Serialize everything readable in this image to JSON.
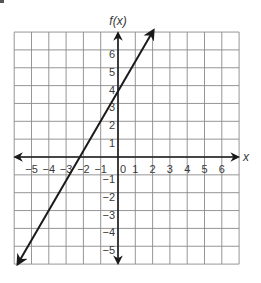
{
  "chart_data": {
    "type": "line",
    "title": "",
    "xlabel": "x",
    "ylabel": "f(x)",
    "xlim": [
      -6,
      7
    ],
    "ylim": [
      -6,
      7
    ],
    "grid": true,
    "x_ticks": [
      -5,
      -4,
      -3,
      -2,
      -1,
      0,
      1,
      2,
      3,
      4,
      5,
      6
    ],
    "y_ticks": [
      -5,
      -4,
      -3,
      -2,
      -1,
      1,
      2,
      3,
      4,
      5,
      6
    ],
    "x_tick_labels": [
      "−5",
      "−4",
      "−3",
      "−2",
      "−1",
      "0",
      "1",
      "2",
      "3",
      "4",
      "5",
      "6"
    ],
    "y_tick_labels": [
      "−5",
      "−4",
      "−3",
      "−2",
      "−1",
      "1",
      "2",
      "3",
      "4",
      "5",
      "6"
    ],
    "series": [
      {
        "name": "f(x)",
        "description": "straight line with arrows at both ends",
        "slope": 1.67,
        "y_intercept": 3.67,
        "x_intercept": -2.2,
        "x": [
          -5.8,
          2.05
        ],
        "y": [
          -6.0,
          7.1
        ]
      }
    ],
    "colors": {
      "line": "#1a1a1a",
      "grid": "#8a8a8a",
      "axes": "#1a1a1a",
      "text": "#3a3a3a"
    }
  },
  "labels": {
    "y_axis_title": "f(x)",
    "x_axis_title": "x"
  }
}
